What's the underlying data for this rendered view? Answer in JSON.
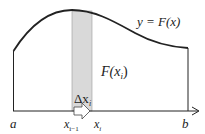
{
  "diagram": {
    "curve_label": "y = F(x)",
    "strip_height_label": "F(x",
    "strip_height_sub": "i",
    "delta_label": "Δx",
    "delta_sub": "i",
    "axis_labels": {
      "a": "a",
      "b": "b",
      "x_im1": "x",
      "x_im1_sub": "i−1",
      "x_i": "x",
      "x_i_sub": "i"
    },
    "colors": {
      "strip_fill": "#d9d9d9",
      "line": "#222222"
    }
  }
}
